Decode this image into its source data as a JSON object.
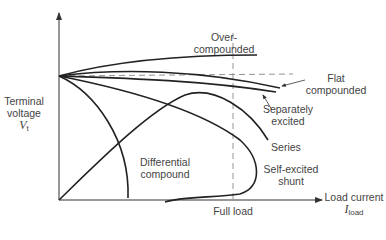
{
  "diagram": {
    "type": "dc-generator-terminal-characteristics",
    "y_axis": {
      "label_line1": "Terminal",
      "label_line2": "voltage",
      "symbol": "V",
      "symbol_sub": "t"
    },
    "x_axis": {
      "label": "Load current",
      "symbol": "I",
      "symbol_sub": "load",
      "marker_label": "Full load"
    },
    "curves": [
      {
        "id": "over-compounded",
        "label_line1": "Over-",
        "label_line2": "compounded"
      },
      {
        "id": "flat-compounded",
        "label_line1": "Flat",
        "label_line2": "compounded"
      },
      {
        "id": "separately-excited",
        "label_line1": "Separately",
        "label_line2": "excited"
      },
      {
        "id": "series",
        "label_line1": "Series"
      },
      {
        "id": "self-excited-shunt",
        "label_line1": "Self-excited",
        "label_line2": "shunt"
      },
      {
        "id": "differential-compound",
        "label_line1": "Differential",
        "label_line2": "compound"
      }
    ],
    "colors": {
      "line": "#222222",
      "dashed": "#888888",
      "text": "#444444"
    }
  }
}
